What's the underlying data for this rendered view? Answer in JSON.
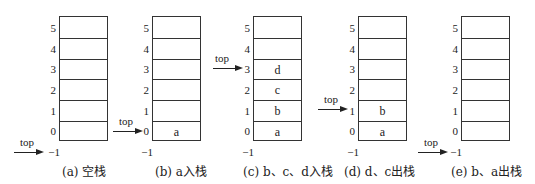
{
  "figure": {
    "indices": [
      "5",
      "4",
      "3",
      "2",
      "1",
      "0",
      "−1"
    ],
    "pointer_label": "top",
    "panels": [
      {
        "id": "a",
        "caption": "(a) 空栈",
        "cells": [
          "",
          "",
          "",
          "",
          "",
          ""
        ],
        "top_index": -1
      },
      {
        "id": "b",
        "caption": "(b) a入栈",
        "cells": [
          "",
          "",
          "",
          "",
          "",
          "a"
        ],
        "top_index": 0
      },
      {
        "id": "c",
        "caption": "(c) b、c、d入栈",
        "cells": [
          "",
          "",
          "d",
          "c",
          "b",
          "a"
        ],
        "top_index": 3
      },
      {
        "id": "d",
        "caption": "(d) d、c出栈",
        "cells": [
          "",
          "",
          "",
          "",
          "b",
          "a"
        ],
        "top_index": 1
      },
      {
        "id": "e",
        "caption": "(e) b、a出栈",
        "cells": [
          "",
          "",
          "",
          "",
          "",
          ""
        ],
        "top_index": -1
      }
    ]
  }
}
